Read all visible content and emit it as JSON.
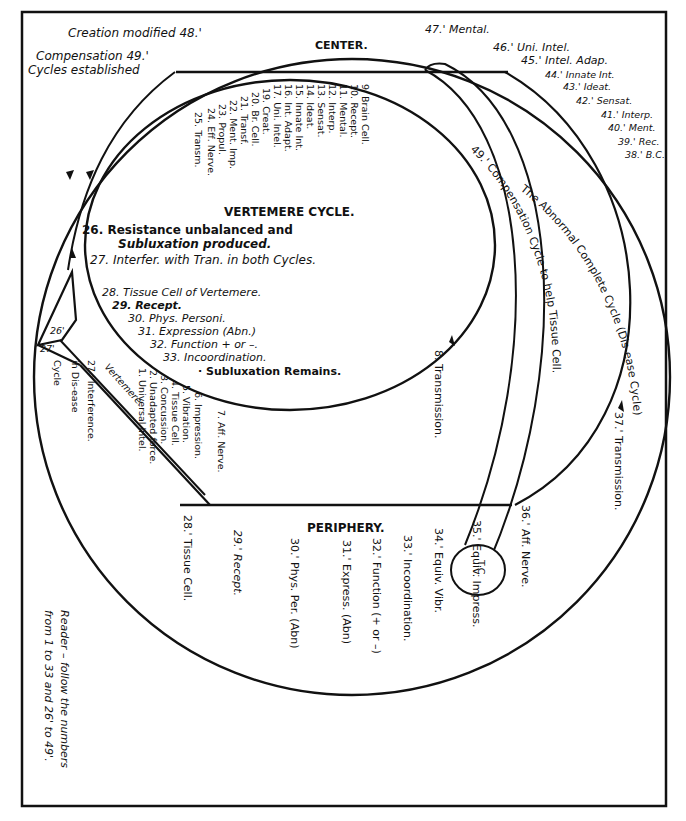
{
  "diagram": {
    "frame_color": "#111111",
    "background": "#ffffff",
    "headings": {
      "center": "CENTER.",
      "periphery": "PERIPHERY.",
      "vertemere_cycle": "VERTEMERE CYCLE."
    },
    "top_left": {
      "creation": "Creation modified 48.'",
      "compensation": "Compensation 49.'",
      "cycles": "Cycles established"
    },
    "normal_cycle": [
      "1. Universal Intel.",
      "2. Unadapted force.",
      "3. Concussion.",
      "4. Tissue Cell.",
      "5. Vibration.",
      "6. Impression.",
      "7. Aff. Nerve.",
      "8. Transmission.",
      "9. Brain Cell.",
      "10. Recept.",
      "11. Mental.",
      "12. Interp.",
      "13. Sensat.",
      "14. Ideat.",
      "15. Innate Int.",
      "16. Int. Adapt.",
      "17. Uni. Intel.",
      "19. Creat.",
      "20. Br. Cell.",
      "21. Transf.",
      "22. Ment. Imp.",
      "23. Propul.",
      "24. Eff. Nerve.",
      "25. Transm."
    ],
    "vertemere_items": [
      "26. Resistance unbalanced and",
      "Subluxation produced.",
      "27. Interfer. with Tran. in both Cycles.",
      "28. Tissue Cell of Vertemere.",
      "29. Recept.",
      "30. Phys. Personi.",
      "31. Expression (Abn.)",
      "32. Function + or –.",
      "33. Incoordination.",
      "· Subluxation Remains."
    ],
    "left_labels": {
      "l26p": "26'",
      "l27p": "27'",
      "cycle": "Cycle",
      "in_disease": "in Dis-ease",
      "interference": "27.' Interference.",
      "vertemere": "Vertemere."
    },
    "abnormal_cycle": [
      "28.' Tissue Cell.",
      "29.' Recept.",
      "30.' Phys. Per. (Abn)",
      "31.' Express. (Abn)",
      "32.' Function (+ or –)",
      "33.' Incoordination.",
      "34.' Equiv. Vibr.",
      "35.' Equiv. Impress.",
      "36.' Aff. Nerve.",
      "37.' Transmission.",
      "38.' B.C.",
      "39.' Rec.",
      "40.' Ment.",
      "41.' Interp.",
      "42.' Sensat.",
      "43.' Ideat.",
      "44.' Innate Int.",
      "45.' Intel. Adap.",
      "46.' Uni. Intel.",
      "47.' Mental."
    ],
    "arc_labels": {
      "abnormal": "The Abnormal Complete Cycle (Dis-ease Cycle)",
      "compensation": "49.' Compensation Cycle to help Tissue Cell."
    },
    "tc_label": "T.C.",
    "reader_note": {
      "line1": "Reader – follow the numbers",
      "line2": "from 1 to 33 and 26' to 49'."
    }
  }
}
